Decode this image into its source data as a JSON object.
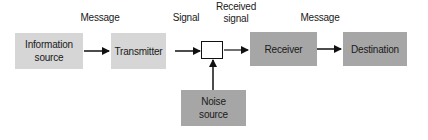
{
  "diagram": {
    "type": "block-diagram",
    "nodes": {
      "information_source": {
        "label": "Information\nsource",
        "line1": "Information",
        "line2": "source"
      },
      "transmitter": {
        "label": "Transmitter"
      },
      "mixer": {
        "label": ""
      },
      "receiver": {
        "label": "Receiver"
      },
      "destination": {
        "label": "Destination"
      },
      "noise_source": {
        "label": "Noise\nsource",
        "line1": "Noise",
        "line2": "source"
      }
    },
    "edge_labels": {
      "message_1": "Message",
      "signal": "Signal",
      "received_signal_line1": "Received",
      "received_signal_line2": "signal",
      "message_2": "Message"
    },
    "edges": [
      {
        "from": "information_source",
        "to": "transmitter",
        "label": "Message"
      },
      {
        "from": "transmitter",
        "to": "mixer",
        "label": "Signal"
      },
      {
        "from": "mixer",
        "to": "receiver",
        "label": "Received signal"
      },
      {
        "from": "receiver",
        "to": "destination",
        "label": "Message"
      },
      {
        "from": "noise_source",
        "to": "mixer",
        "label": ""
      }
    ],
    "colors": {
      "light_box": "#d6d6d6",
      "dark_box": "#a6a6a6",
      "arrow": "#111111"
    }
  }
}
